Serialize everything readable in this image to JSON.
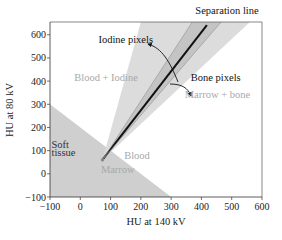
{
  "chart_data": {
    "type": "scatter",
    "title": "",
    "xlabel": "HU at 140 kV",
    "ylabel": "HU at 80 kV",
    "xlim": [
      -100,
      600
    ],
    "ylim": [
      -100,
      655
    ],
    "xticks": [
      -100,
      0,
      100,
      200,
      300,
      400,
      500,
      600
    ],
    "yticks": [
      -100,
      0,
      100,
      200,
      300,
      400,
      500,
      600
    ],
    "xtick_labels": [
      "−100",
      "0",
      "100",
      "200",
      "300",
      "400",
      "500",
      "600"
    ],
    "ytick_labels": [
      "−100",
      "0",
      "100",
      "200",
      "300",
      "400",
      "500",
      "600"
    ],
    "grid": false,
    "regions": [
      {
        "name": "soft-tissue-region",
        "description": "Soft tissue / blood / marrow triangle below line x + y = 200",
        "polygon": [
          [
            -100,
            -100
          ],
          [
            -100,
            300
          ],
          [
            300,
            -100
          ]
        ],
        "color": "#cfcfcf"
      },
      {
        "name": "outer-wedge",
        "description": "Mixture wedge (blood + iodine to marrow + bone)",
        "polygon": [
          [
            73,
            60
          ],
          [
            200,
            655
          ],
          [
            560,
            655
          ]
        ],
        "color": "#dcdcdc"
      },
      {
        "name": "inner-band",
        "description": "Darker band around separation line",
        "polygon": [
          [
            73,
            60
          ],
          [
            370,
            655
          ],
          [
            465,
            655
          ]
        ],
        "color": "#c4c4c4"
      }
    ],
    "lines": [
      {
        "name": "separation-line",
        "points": [
          [
            73,
            60
          ],
          [
            418,
            642
          ]
        ],
        "color": "#111111"
      },
      {
        "name": "band-edge-left",
        "points": [
          [
            73,
            60
          ],
          [
            370,
            655
          ]
        ],
        "color": "#9a9a9a"
      },
      {
        "name": "band-edge-right",
        "points": [
          [
            73,
            60
          ],
          [
            465,
            655
          ]
        ],
        "color": "#9a9a9a"
      }
    ],
    "annotations": [
      {
        "text": "Separation line",
        "style": "dark",
        "at": [
          380,
          690
        ]
      },
      {
        "text": "Iodine pixels",
        "style": "dark",
        "at": [
          60,
          565
        ]
      },
      {
        "text": "Bone pixels",
        "style": "dark",
        "at": [
          365,
          400
        ]
      },
      {
        "text": "Blood + Iodine",
        "style": "light",
        "at": [
          -20,
          400
        ]
      },
      {
        "text": "Marrow + bone",
        "style": "light",
        "at": [
          345,
          325
        ]
      },
      {
        "text": "Soft",
        "style": "mid",
        "at": [
          -95,
          112
        ]
      },
      {
        "text": "tissue",
        "style": "mid",
        "at": [
          -95,
          77
        ]
      },
      {
        "text": "Blood",
        "style": "light",
        "at": [
          145,
          62
        ]
      },
      {
        "text": "Marrow",
        "style": "light",
        "at": [
          68,
          5
        ]
      }
    ]
  }
}
